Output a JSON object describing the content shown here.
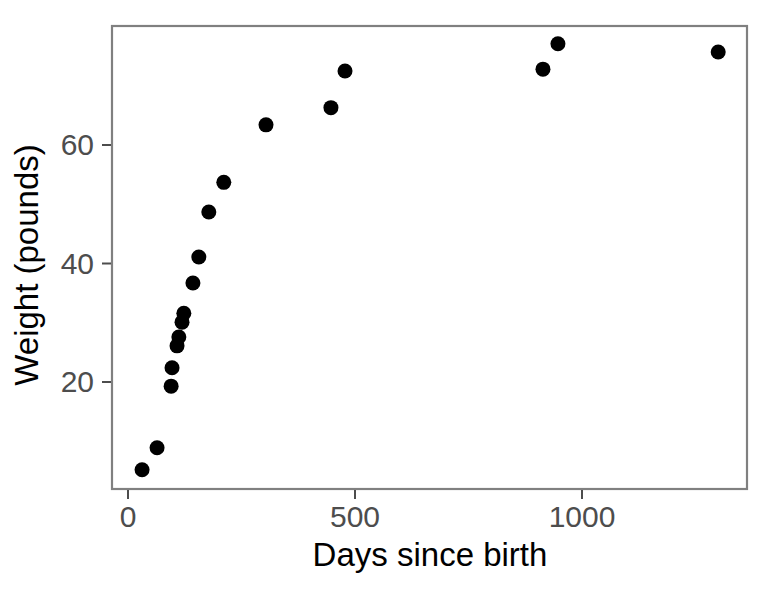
{
  "chart_data": {
    "type": "scatter",
    "title": "",
    "xlabel": "Days since birth",
    "ylabel": "Weight (pounds)",
    "xlim": [
      -20,
      1363
    ],
    "ylim": [
      2.5,
      80
    ],
    "xticks": [
      0,
      500,
      1000
    ],
    "xtick_labels": [
      "0",
      "500",
      "1000"
    ],
    "yticks": [
      20,
      40,
      60
    ],
    "ytick_labels": [
      "20",
      "40",
      "60"
    ],
    "grid": false,
    "legend": null,
    "point_color": "#000000",
    "panel_border_color": "#808080",
    "axis_text_color": "#4d4d4d",
    "x": [
      31,
      64,
      95,
      97,
      108,
      112,
      119,
      123,
      143,
      156,
      178,
      211,
      304,
      447,
      478,
      914,
      947,
      1300
    ],
    "y": [
      5.2,
      8.9,
      19.3,
      22.4,
      26.1,
      27.6,
      30.1,
      31.6,
      36.7,
      41.1,
      48.7,
      53.7,
      63.4,
      66.3,
      72.5,
      72.8,
      77.1,
      75.7
    ],
    "points": [
      {
        "x": 31,
        "y": 5.2
      },
      {
        "x": 64,
        "y": 8.9
      },
      {
        "x": 95,
        "y": 19.3
      },
      {
        "x": 97,
        "y": 22.4
      },
      {
        "x": 108,
        "y": 26.1
      },
      {
        "x": 112,
        "y": 27.6
      },
      {
        "x": 119,
        "y": 30.1
      },
      {
        "x": 123,
        "y": 31.6
      },
      {
        "x": 143,
        "y": 36.7
      },
      {
        "x": 156,
        "y": 41.1
      },
      {
        "x": 178,
        "y": 48.7
      },
      {
        "x": 211,
        "y": 53.7
      },
      {
        "x": 304,
        "y": 63.4
      },
      {
        "x": 447,
        "y": 66.3
      },
      {
        "x": 478,
        "y": 72.5
      },
      {
        "x": 914,
        "y": 72.8
      },
      {
        "x": 947,
        "y": 77.1
      },
      {
        "x": 1300,
        "y": 75.7
      }
    ],
    "point_radius_px": 7.5,
    "n_points": 18
  },
  "geometry": {
    "panel": {
      "left": 112,
      "top": 26,
      "right": 747,
      "bottom": 489
    },
    "x_axis": {
      "px_at_0": 128,
      "px_at_500": 355,
      "px_per_unit": 0.454
    },
    "y_axis": {
      "px_at_20": 382,
      "px_at_60": 145,
      "px_per_unit": 5.925
    }
  }
}
